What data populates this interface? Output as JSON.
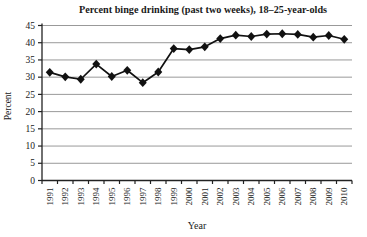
{
  "figure": {
    "background": "#ffffff"
  },
  "chart_data": {
    "type": "line",
    "title": "Percent binge drinking (past two weeks), 18–25-year-olds",
    "xlabel": "Year",
    "ylabel": "Percent",
    "ylim": [
      0,
      45
    ],
    "ytick_step": 5,
    "yticks": [
      0,
      5,
      10,
      15,
      20,
      25,
      30,
      35,
      40,
      45
    ],
    "grid": "horizontal",
    "legend_position": "none",
    "marker": "filled-diamond",
    "colors": {
      "series": "#111111",
      "grid": "#999999",
      "axis": "#222222",
      "text": "#1a1a1a"
    },
    "categories": [
      "1991",
      "1992",
      "1993",
      "1994",
      "1995",
      "1996",
      "1997",
      "1998",
      "1999",
      "2000",
      "2001",
      "2002",
      "2003",
      "2004",
      "2005",
      "2006",
      "2007",
      "2008",
      "2009",
      "2010"
    ],
    "values": [
      31.4,
      30.1,
      29.4,
      33.8,
      30.2,
      32.0,
      28.4,
      31.5,
      38.3,
      38.0,
      38.8,
      41.2,
      42.2,
      41.8,
      42.5,
      42.6,
      42.4,
      41.6,
      42.1,
      41.0
    ]
  }
}
